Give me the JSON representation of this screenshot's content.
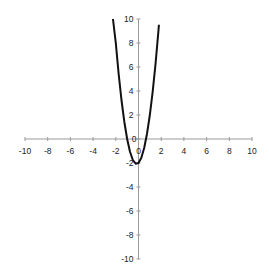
{
  "chart_data": {
    "type": "line",
    "title": "",
    "xlabel": "",
    "ylabel": "",
    "xlim": [
      -10,
      10
    ],
    "ylim": [
      -10,
      10
    ],
    "grid": false,
    "legend": null,
    "x_ticks": [
      -10,
      -8,
      -6,
      -4,
      -2,
      0,
      2,
      4,
      6,
      8,
      10
    ],
    "y_ticks": [
      -10,
      -8,
      -6,
      -4,
      -2,
      0,
      2,
      4,
      6,
      8,
      10
    ],
    "series": [
      {
        "name": "curve",
        "color": "#111111",
        "x": [
          -2.25,
          -2.0,
          -1.75,
          -1.5,
          -1.25,
          -1.0,
          -0.75,
          -0.5,
          -0.25,
          0.0,
          0.25,
          0.5,
          0.75,
          1.0,
          1.25,
          1.5,
          1.75,
          1.8
        ],
        "y": [
          10.9,
          8.0,
          5.44,
          3.25,
          1.44,
          0.0,
          -1.06,
          -1.75,
          -2.06,
          -2.0,
          -1.56,
          -0.75,
          0.44,
          2.0,
          3.94,
          6.25,
          8.94,
          9.52
        ]
      }
    ]
  },
  "colors": {
    "axis": "#9a9a9a",
    "curve": "#111111",
    "text": "#222222"
  }
}
